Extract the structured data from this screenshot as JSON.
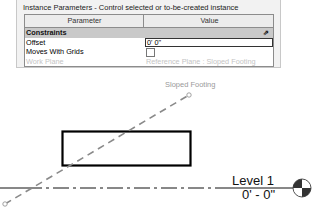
{
  "properties_panel": {
    "title": "Instance Parameters - Control selected or to-be-created instance",
    "columns": [
      "Parameter",
      "Value"
    ],
    "group": {
      "label": "Constraints",
      "collapse_icon": "double-chevron-up"
    },
    "rows": [
      {
        "param": "Offset",
        "value": "0'  0\"",
        "type": "text-input"
      },
      {
        "param": "Moves With Grids",
        "value": "",
        "type": "checkbox",
        "checked": false
      },
      {
        "param": "Work Plane",
        "value": "Reference Plane : Sloped Footing",
        "type": "disabled"
      }
    ]
  },
  "view": {
    "reference_plane_label": "Sloped Footing",
    "level_name": "Level 1",
    "level_elevation": "0' - 0\"",
    "colors": {
      "reference_plane": "#8a8a8a",
      "level_line": "#111111",
      "footing": "#000000"
    }
  }
}
